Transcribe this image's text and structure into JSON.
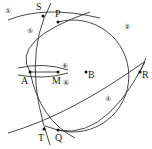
{
  "points": [
    {
      "name": "S",
      "x": 43,
      "y": 16,
      "lx": 36,
      "ly": 10
    },
    {
      "name": "P",
      "x": 58,
      "y": 22,
      "lx": 55,
      "ly": 17
    },
    {
      "name": "A",
      "x": 30,
      "y": 72,
      "lx": 21,
      "ly": 84
    },
    {
      "name": "M",
      "x": 58,
      "y": 72,
      "lx": 53,
      "ly": 84
    },
    {
      "name": "B",
      "x": 86,
      "y": 72,
      "lx": 88,
      "ly": 78
    },
    {
      "name": "R",
      "x": 140,
      "y": 72,
      "lx": 142,
      "ly": 78
    },
    {
      "name": "Q",
      "x": 58,
      "y": 130,
      "lx": 55,
      "ly": 141
    },
    {
      "name": "T",
      "x": 44,
      "y": 129,
      "lx": 38,
      "ly": 141
    }
  ],
  "step_labels": [
    {
      "text": "①",
      "x": 5,
      "y": 13
    },
    {
      "text": "②",
      "x": 124,
      "y": 29
    },
    {
      "text": "⑤",
      "x": 27,
      "y": 33
    },
    {
      "text": "⑥",
      "x": 62,
      "y": 68
    },
    {
      "text": "⑥",
      "x": 63,
      "y": 85
    },
    {
      "text": "④",
      "x": 105,
      "y": 101
    }
  ]
}
